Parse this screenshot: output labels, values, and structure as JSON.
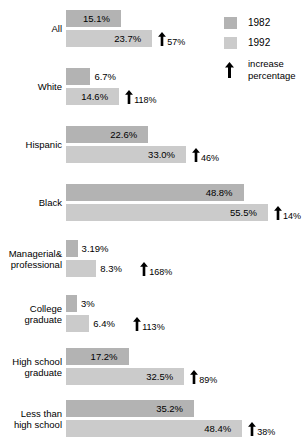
{
  "chart_data": {
    "type": "bar",
    "orientation": "horizontal",
    "title": "",
    "subtitle": "",
    "xlabel": "",
    "ylabel": "",
    "xlim": [
      0,
      60
    ],
    "grid": false,
    "legend_position": "top-right",
    "categories": [
      "All",
      "White",
      "Hispanic",
      "Black",
      "Managerial& professional",
      "College graduate",
      "High school graduate",
      "Less than high school"
    ],
    "series": [
      {
        "name": "1982",
        "color": "#b3b3b3",
        "values": [
          15.1,
          6.7,
          22.6,
          48.8,
          3.19,
          3,
          17.2,
          35.2
        ]
      },
      {
        "name": "1992",
        "color": "#cbcbcb",
        "values": [
          23.7,
          14.6,
          33.0,
          55.5,
          8.3,
          6.4,
          32.5,
          48.4
        ]
      }
    ],
    "annotations": {
      "name": "increase percentage",
      "values": [
        57,
        118,
        46,
        14,
        168,
        113,
        89,
        38
      ]
    }
  },
  "groups": [
    {
      "label_line1": "All",
      "label_line2": "",
      "bar1982": {
        "value": 15.1,
        "label": "15.1%"
      },
      "bar1992": {
        "value": 23.7,
        "label": "23.7%"
      },
      "increase": "57%"
    },
    {
      "label_line1": "White",
      "label_line2": "",
      "bar1982": {
        "value": 6.7,
        "label": "6.7%"
      },
      "bar1992": {
        "value": 14.6,
        "label": "14.6%"
      },
      "increase": "118%"
    },
    {
      "label_line1": "Hispanic",
      "label_line2": "",
      "bar1982": {
        "value": 22.6,
        "label": "22.6%"
      },
      "bar1992": {
        "value": 33.0,
        "label": "33.0%"
      },
      "increase": "46%"
    },
    {
      "label_line1": "Black",
      "label_line2": "",
      "bar1982": {
        "value": 48.8,
        "label": "48.8%"
      },
      "bar1992": {
        "value": 55.5,
        "label": "55.5%"
      },
      "increase": "14%"
    },
    {
      "label_line1": "Managerial&",
      "label_line2": "professional",
      "bar1982": {
        "value": 3.19,
        "label": "3.19%"
      },
      "bar1992": {
        "value": 8.3,
        "label": "8.3%"
      },
      "increase": "168%"
    },
    {
      "label_line1": "College",
      "label_line2": "graduate",
      "bar1982": {
        "value": 3,
        "label": "3%"
      },
      "bar1992": {
        "value": 6.4,
        "label": "6.4%"
      },
      "increase": "113%"
    },
    {
      "label_line1": "High school",
      "label_line2": "graduate",
      "bar1982": {
        "value": 17.2,
        "label": "17.2%"
      },
      "bar1992": {
        "value": 32.5,
        "label": "32.5%"
      },
      "increase": "89%"
    },
    {
      "label_line1": "Less than",
      "label_line2": "high school",
      "bar1982": {
        "value": 35.2,
        "label": "35.2%"
      },
      "bar1992": {
        "value": 48.4,
        "label": "48.4%"
      },
      "increase": "38%"
    }
  ],
  "legend": {
    "item1982": "1982",
    "item1992": "1992",
    "arrow_line1": "increase",
    "arrow_line2": "percentage",
    "color1982": "#b3b3b3",
    "color1992": "#cbcbcb",
    "arrow_icon": "up-arrow-icon"
  },
  "layout": {
    "bar_origin_x": 66,
    "px_per_percent": 3.64,
    "bar_height": 17,
    "pair_gap": 3,
    "group_tops": [
      10,
      68,
      126,
      184,
      240,
      295,
      348,
      400
    ]
  }
}
